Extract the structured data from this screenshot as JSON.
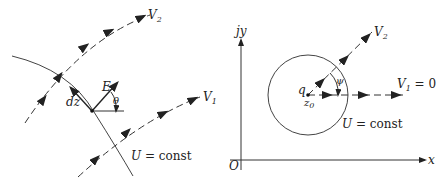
{
  "left_panel": {
    "labels": {
      "v2": "V",
      "v2_sub": "2",
      "v1": "V",
      "v1_sub": "1",
      "e": "E",
      "theta": "θ",
      "dz": "dz",
      "u_const": "U",
      "u_const_rest": " = const"
    }
  },
  "right_panel": {
    "labels": {
      "jy": "jy",
      "x": "x",
      "origin": "O",
      "v2": "V",
      "v2_sub": "2",
      "v1": "V",
      "v1_sub": "1",
      "v1_eq": " = 0",
      "q": "q",
      "z0": "z",
      "z0_sub": "0",
      "psi": "ψ",
      "u_const": "U",
      "u_const_rest": " = const"
    }
  }
}
